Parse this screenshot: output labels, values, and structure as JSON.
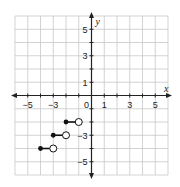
{
  "chart_data": {
    "type": "scatter",
    "subtype": "step-function",
    "title": "",
    "xlabel": "x",
    "ylabel": "y",
    "xlim": [
      -6,
      6
    ],
    "ylim": [
      -6,
      6
    ],
    "grid": true,
    "x_tick_labels": [
      "−5",
      "−3",
      "0",
      "1",
      "3",
      "5"
    ],
    "x_tick_values": [
      -5,
      -3,
      0,
      1,
      3,
      5
    ],
    "y_tick_labels": [
      "5",
      "3",
      "1",
      "−3",
      "−5"
    ],
    "y_tick_values": [
      5,
      3,
      1,
      -3,
      -5
    ],
    "segments": [
      {
        "closed": [
          -2,
          -2
        ],
        "open": [
          -1,
          -2
        ]
      },
      {
        "closed": [
          -3,
          -3
        ],
        "open": [
          -2,
          -3
        ]
      },
      {
        "closed": [
          -4,
          -4
        ],
        "open": [
          -3,
          -4
        ]
      }
    ],
    "colors": {
      "grid": "#c8c8c8",
      "axis": "#222222",
      "point": "#111111",
      "open_fill": "#ffffff"
    }
  }
}
